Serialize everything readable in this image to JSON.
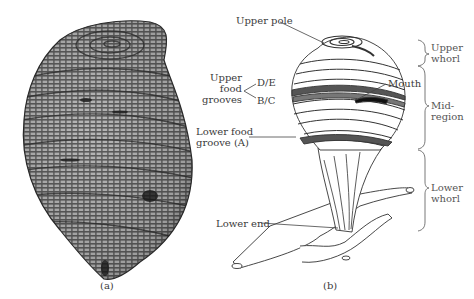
{
  "figure": {
    "panel_a": {
      "caption": "(a)",
      "content": "photograph of organism"
    },
    "panel_b": {
      "caption": "(b)",
      "labels": {
        "upper_pole": "Upper pole",
        "upper_food_grooves_line1": "Upper",
        "upper_food_grooves_line2": "food",
        "upper_food_grooves_line3": "grooves",
        "de": "D/E",
        "bc": "B/C",
        "mouth": "Mouth",
        "lower_food_groove_line1": "Lower food",
        "lower_food_groove_line2": "groove (A)",
        "lower_end": "Lower end"
      },
      "regions": [
        {
          "line1": "Upper",
          "line2": "whorl"
        },
        {
          "line1": "Mid-",
          "line2": "region"
        },
        {
          "line1": "Lower",
          "line2": "whorl"
        }
      ]
    }
  }
}
